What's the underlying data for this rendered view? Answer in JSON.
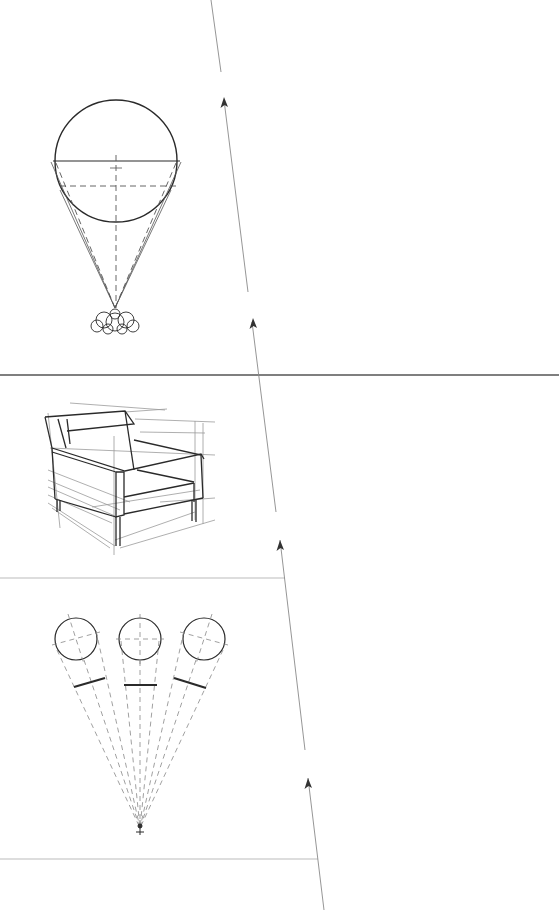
{
  "page": {
    "width": 559,
    "height": 913,
    "background": "#ffffff",
    "ink_color": "#2a2a2a",
    "rule_color": "#9a9a9a"
  },
  "dividers": [
    {
      "name": "divider-top",
      "x1": 0,
      "y1": 375,
      "x2": 559,
      "y2": 375,
      "weight": 1.6,
      "color": "#555555"
    },
    {
      "name": "divider-middle",
      "x1": 0,
      "y1": 578,
      "x2": 285,
      "y2": 578,
      "weight": 0.8,
      "color": "#aaaaaa"
    },
    {
      "name": "divider-bottom",
      "x1": 0,
      "y1": 859,
      "x2": 318,
      "y2": 859,
      "weight": 0.8,
      "color": "#aaaaaa"
    }
  ],
  "direction_line": {
    "segments": [
      {
        "x1": 211,
        "y1": 0,
        "x2": 221,
        "y2": 72
      },
      {
        "x1": 224,
        "y1": 100,
        "x2": 248,
        "y2": 292
      },
      {
        "x1": 252,
        "y1": 322,
        "x2": 276,
        "y2": 512
      },
      {
        "x1": 280,
        "y1": 540,
        "x2": 305,
        "y2": 750
      },
      {
        "x1": 308,
        "y1": 778,
        "x2": 324,
        "y2": 910
      }
    ],
    "arrowheads": [
      {
        "x": 224,
        "y": 97
      },
      {
        "x": 253,
        "y": 318
      },
      {
        "x": 280,
        "y": 540
      },
      {
        "x": 308,
        "y": 778
      }
    ]
  },
  "figures": [
    {
      "name": "sphere-cone-of-vision",
      "circle": {
        "cx": 116,
        "cy": 161,
        "r": 61
      },
      "horizontal_solid_y": 161,
      "horizontal_dashed_y": 186,
      "apex": {
        "x": 115,
        "y": 308
      },
      "observer_cloud": {
        "cx": 115,
        "cy": 322
      }
    },
    {
      "name": "armchair-perspective-sketch"
    },
    {
      "name": "three-spheres-projection",
      "circles": [
        {
          "cx": 76,
          "cy": 639,
          "r": 21
        },
        {
          "cx": 140,
          "cy": 639,
          "r": 21
        },
        {
          "cx": 204,
          "cy": 639,
          "r": 21
        }
      ],
      "projection_bars": [
        {
          "x1": 74,
          "y1": 687,
          "x2": 105,
          "y2": 678
        },
        {
          "x1": 124,
          "y1": 685,
          "x2": 157,
          "y2": 685
        },
        {
          "x1": 174,
          "y1": 678,
          "x2": 206,
          "y2": 688
        }
      ],
      "station_point": {
        "x": 140,
        "y": 828
      }
    }
  ]
}
